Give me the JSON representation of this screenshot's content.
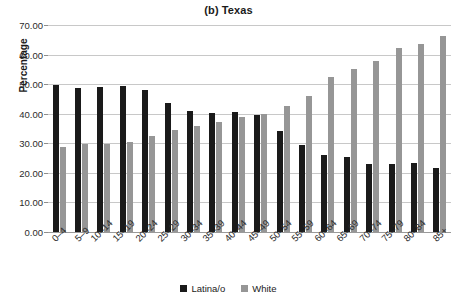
{
  "chart_data": {
    "type": "bar",
    "title": "(b) Texas",
    "xlabel": "",
    "ylabel": "Percentage",
    "ylim": [
      0,
      70
    ],
    "ytick_step": 10,
    "ytick_labels": [
      "0.00",
      "10.00",
      "20.00",
      "30.00",
      "40.00",
      "50.00",
      "60.00",
      "70.00"
    ],
    "grid": true,
    "legend_position": "bottom-center",
    "categories": [
      "0–4",
      "5–9",
      "10–14",
      "15–19",
      "20–24",
      "25–29",
      "30–34",
      "35–39",
      "40–44",
      "45–49",
      "50–54",
      "55–59",
      "60–64",
      "65–69",
      "70–74",
      "75–79",
      "80–84",
      "85+"
    ],
    "series": [
      {
        "name": "Latina/o",
        "color": "#1a1a1a",
        "values": [
          49.6,
          48.6,
          49.1,
          49.4,
          48.0,
          43.6,
          40.8,
          40.4,
          40.7,
          39.6,
          34.0,
          29.5,
          26.2,
          25.2,
          23.0,
          23.1,
          23.4,
          21.7
        ]
      },
      {
        "name": "White",
        "color": "#969696",
        "values": [
          28.8,
          29.9,
          29.9,
          30.4,
          32.3,
          34.5,
          35.8,
          37.3,
          38.8,
          39.9,
          42.6,
          45.9,
          52.3,
          55.0,
          58.0,
          62.2,
          63.5,
          66.4
        ]
      }
    ]
  },
  "legend": {
    "items": [
      {
        "label": "Latina/o",
        "color": "#1a1a1a"
      },
      {
        "label": "White",
        "color": "#969696"
      }
    ]
  }
}
